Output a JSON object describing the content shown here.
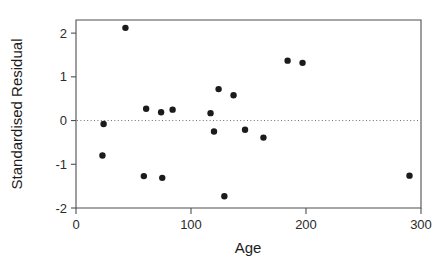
{
  "chart_data": {
    "type": "scatter",
    "title": "",
    "xlabel": "Age",
    "ylabel": "Standardised Residual",
    "xlim": [
      0,
      300
    ],
    "ylim": [
      -2,
      2.3
    ],
    "xticks": [
      0,
      100,
      200,
      300
    ],
    "xtick_labels": [
      "0",
      "100",
      "200",
      "300"
    ],
    "yticks": [
      -2,
      -1,
      0,
      1,
      2
    ],
    "ytick_labels": [
      "-2",
      "-1",
      "0",
      "1",
      "2"
    ],
    "grid": false,
    "legend": "none",
    "annotations": [
      {
        "name": "zero-reference-line",
        "type": "horizontal-dotted-line",
        "y": 0,
        "style": "dotted",
        "color": "#6d6d6d"
      }
    ],
    "series": [
      {
        "name": "residuals",
        "marker": "filled-circle",
        "color": "#1b1b1b",
        "points": [
          {
            "x": 24,
            "y": -0.08
          },
          {
            "x": 23,
            "y": -0.8
          },
          {
            "x": 43,
            "y": 2.12
          },
          {
            "x": 59,
            "y": -1.27
          },
          {
            "x": 61,
            "y": 0.27
          },
          {
            "x": 74,
            "y": 0.19
          },
          {
            "x": 75,
            "y": -1.31
          },
          {
            "x": 84,
            "y": 0.25
          },
          {
            "x": 117,
            "y": 0.17
          },
          {
            "x": 120,
            "y": -0.25
          },
          {
            "x": 124,
            "y": 0.72
          },
          {
            "x": 129,
            "y": -1.73
          },
          {
            "x": 137,
            "y": 0.58
          },
          {
            "x": 147,
            "y": -0.21
          },
          {
            "x": 163,
            "y": -0.39
          },
          {
            "x": 184,
            "y": 1.37
          },
          {
            "x": 197,
            "y": 1.32
          },
          {
            "x": 290,
            "y": -1.26
          }
        ]
      }
    ]
  },
  "axes": {
    "x_title": "Age",
    "y_title": "Standardised Residual"
  }
}
